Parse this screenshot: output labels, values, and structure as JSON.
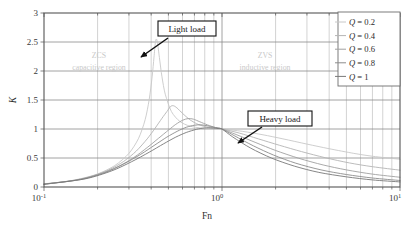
{
  "chart_data": {
    "type": "line",
    "title": "",
    "xlabel": "Fn",
    "ylabel": "K",
    "xscale": "log",
    "yscale": "linear",
    "xlim": [
      0.1,
      10
    ],
    "ylim": [
      0,
      3
    ],
    "xticks": [
      "10-1",
      "100",
      "101"
    ],
    "xtick_labels": [
      "10⁻¹",
      "10⁰",
      "10¹"
    ],
    "yticks": [
      0,
      0.5,
      1,
      1.5,
      2,
      2.5,
      3
    ],
    "ytick_labels": [
      "0",
      "0.5",
      "1",
      "1.5",
      "2",
      "2.5",
      "3"
    ],
    "grid": true,
    "grid_minor": true,
    "legend_position": "top-right",
    "series": [
      {
        "name": "Q = 0.2",
        "q": 0.2,
        "color": "#c8c8c8",
        "peak": {
          "fn": 0.42,
          "k": 2.55
        },
        "points": [
          {
            "fn": 0.1,
            "k": 0.055
          },
          {
            "fn": 0.13,
            "k": 0.092
          },
          {
            "fn": 0.16,
            "k": 0.142
          },
          {
            "fn": 0.2,
            "k": 0.225
          },
          {
            "fn": 0.25,
            "k": 0.37
          },
          {
            "fn": 0.3,
            "k": 0.58
          },
          {
            "fn": 0.34,
            "k": 0.84
          },
          {
            "fn": 0.37,
            "k": 1.16
          },
          {
            "fn": 0.39,
            "k": 1.51
          },
          {
            "fn": 0.405,
            "k": 1.9
          },
          {
            "fn": 0.415,
            "k": 2.24
          },
          {
            "fn": 0.422,
            "k": 2.48
          },
          {
            "fn": 0.428,
            "k": 2.552
          },
          {
            "fn": 0.435,
            "k": 2.47
          },
          {
            "fn": 0.445,
            "k": 2.23
          },
          {
            "fn": 0.46,
            "k": 1.9
          },
          {
            "fn": 0.48,
            "k": 1.6
          },
          {
            "fn": 0.52,
            "k": 1.3
          },
          {
            "fn": 0.58,
            "k": 1.13
          },
          {
            "fn": 0.66,
            "k": 1.05
          },
          {
            "fn": 0.78,
            "k": 1.015
          },
          {
            "fn": 1.0,
            "k": 1.0
          },
          {
            "fn": 1.3,
            "k": 0.96
          },
          {
            "fn": 1.7,
            "k": 0.9
          },
          {
            "fn": 2.2,
            "k": 0.83
          },
          {
            "fn": 3.0,
            "k": 0.74
          },
          {
            "fn": 4.0,
            "k": 0.66
          },
          {
            "fn": 5.5,
            "k": 0.58
          },
          {
            "fn": 7.0,
            "k": 0.53
          },
          {
            "fn": 10.0,
            "k": 0.478
          }
        ]
      },
      {
        "name": "Q = 0.4",
        "q": 0.4,
        "color": "#b4b4b4",
        "peak": {
          "fn": 0.52,
          "k": 1.4
        },
        "points": [
          {
            "fn": 0.1,
            "k": 0.052
          },
          {
            "fn": 0.14,
            "k": 0.103
          },
          {
            "fn": 0.18,
            "k": 0.175
          },
          {
            "fn": 0.23,
            "k": 0.292
          },
          {
            "fn": 0.28,
            "k": 0.44
          },
          {
            "fn": 0.33,
            "k": 0.62
          },
          {
            "fn": 0.38,
            "k": 0.83
          },
          {
            "fn": 0.42,
            "k": 1.01
          },
          {
            "fn": 0.46,
            "k": 1.185
          },
          {
            "fn": 0.49,
            "k": 1.3
          },
          {
            "fn": 0.515,
            "k": 1.39
          },
          {
            "fn": 0.535,
            "k": 1.4
          },
          {
            "fn": 0.56,
            "k": 1.36
          },
          {
            "fn": 0.6,
            "k": 1.27
          },
          {
            "fn": 0.66,
            "k": 1.16
          },
          {
            "fn": 0.74,
            "k": 1.075
          },
          {
            "fn": 0.85,
            "k": 1.025
          },
          {
            "fn": 1.0,
            "k": 1.0
          },
          {
            "fn": 1.25,
            "k": 0.93
          },
          {
            "fn": 1.6,
            "k": 0.83
          },
          {
            "fn": 2.1,
            "k": 0.72
          },
          {
            "fn": 2.8,
            "k": 0.61
          },
          {
            "fn": 3.8,
            "k": 0.505
          },
          {
            "fn": 5.2,
            "k": 0.415
          },
          {
            "fn": 7.0,
            "k": 0.35
          },
          {
            "fn": 10.0,
            "k": 0.29
          }
        ]
      },
      {
        "name": "Q = 0.6",
        "q": 0.6,
        "color": "#a0a0a0",
        "peak": {
          "fn": 0.6,
          "k": 1.18
        },
        "points": [
          {
            "fn": 0.1,
            "k": 0.05
          },
          {
            "fn": 0.15,
            "k": 0.118
          },
          {
            "fn": 0.2,
            "k": 0.212
          },
          {
            "fn": 0.26,
            "k": 0.35
          },
          {
            "fn": 0.32,
            "k": 0.51
          },
          {
            "fn": 0.38,
            "k": 0.68
          },
          {
            "fn": 0.44,
            "k": 0.84
          },
          {
            "fn": 0.5,
            "k": 0.98
          },
          {
            "fn": 0.55,
            "k": 1.08
          },
          {
            "fn": 0.6,
            "k": 1.15
          },
          {
            "fn": 0.645,
            "k": 1.18
          },
          {
            "fn": 0.69,
            "k": 1.17
          },
          {
            "fn": 0.75,
            "k": 1.125
          },
          {
            "fn": 0.83,
            "k": 1.07
          },
          {
            "fn": 0.92,
            "k": 1.025
          },
          {
            "fn": 1.0,
            "k": 1.0
          },
          {
            "fn": 1.2,
            "k": 0.905
          },
          {
            "fn": 1.55,
            "k": 0.765
          },
          {
            "fn": 2.0,
            "k": 0.63
          },
          {
            "fn": 2.7,
            "k": 0.495
          },
          {
            "fn": 3.7,
            "k": 0.38
          },
          {
            "fn": 5.0,
            "k": 0.295
          },
          {
            "fn": 7.0,
            "k": 0.222
          },
          {
            "fn": 10.0,
            "k": 0.168
          }
        ]
      },
      {
        "name": "Q = 0.8",
        "q": 0.8,
        "color": "#8c8c8c",
        "peak": {
          "fn": 0.7,
          "k": 1.08
        },
        "points": [
          {
            "fn": 0.1,
            "k": 0.048
          },
          {
            "fn": 0.16,
            "k": 0.128
          },
          {
            "fn": 0.22,
            "k": 0.248
          },
          {
            "fn": 0.28,
            "k": 0.395
          },
          {
            "fn": 0.35,
            "k": 0.565
          },
          {
            "fn": 0.42,
            "k": 0.725
          },
          {
            "fn": 0.49,
            "k": 0.86
          },
          {
            "fn": 0.56,
            "k": 0.96
          },
          {
            "fn": 0.63,
            "k": 1.03
          },
          {
            "fn": 0.7,
            "k": 1.065
          },
          {
            "fn": 0.76,
            "k": 1.072
          },
          {
            "fn": 0.83,
            "k": 1.055
          },
          {
            "fn": 0.9,
            "k": 1.03
          },
          {
            "fn": 1.0,
            "k": 1.0
          },
          {
            "fn": 1.18,
            "k": 0.88
          },
          {
            "fn": 1.5,
            "k": 0.71
          },
          {
            "fn": 1.95,
            "k": 0.55
          },
          {
            "fn": 2.6,
            "k": 0.41
          },
          {
            "fn": 3.6,
            "k": 0.295
          },
          {
            "fn": 5.0,
            "k": 0.215
          },
          {
            "fn": 7.0,
            "k": 0.155
          },
          {
            "fn": 10.0,
            "k": 0.112
          }
        ]
      },
      {
        "name": "Q = 1",
        "q": 1.0,
        "color": "#787878",
        "peak": {
          "fn": 0.8,
          "k": 1.02
        },
        "points": [
          {
            "fn": 0.1,
            "k": 0.046
          },
          {
            "fn": 0.17,
            "k": 0.14
          },
          {
            "fn": 0.24,
            "k": 0.278
          },
          {
            "fn": 0.31,
            "k": 0.435
          },
          {
            "fn": 0.39,
            "k": 0.6
          },
          {
            "fn": 0.47,
            "k": 0.745
          },
          {
            "fn": 0.55,
            "k": 0.86
          },
          {
            "fn": 0.63,
            "k": 0.94
          },
          {
            "fn": 0.72,
            "k": 0.995
          },
          {
            "fn": 0.8,
            "k": 1.018
          },
          {
            "fn": 0.88,
            "k": 1.018
          },
          {
            "fn": 0.95,
            "k": 1.008
          },
          {
            "fn": 1.0,
            "k": 1.0
          },
          {
            "fn": 1.15,
            "k": 0.862
          },
          {
            "fn": 1.45,
            "k": 0.67
          },
          {
            "fn": 1.9,
            "k": 0.498
          },
          {
            "fn": 2.55,
            "k": 0.36
          },
          {
            "fn": 3.5,
            "k": 0.252
          },
          {
            "fn": 5.0,
            "k": 0.175
          },
          {
            "fn": 7.0,
            "k": 0.122
          },
          {
            "fn": 10.0,
            "k": 0.088
          }
        ]
      }
    ],
    "annotations": [
      {
        "id": "light-load",
        "text": "Light load",
        "box": {
          "x": 158,
          "y": 21,
          "w": 58,
          "h": 15
        },
        "arrow": {
          "x1": 168,
          "y1": 38,
          "x2": 141,
          "y2": 57
        }
      },
      {
        "id": "heavy-load",
        "text": "Heavy load",
        "box": {
          "x": 248,
          "y": 111,
          "w": 64,
          "h": 15
        },
        "arrow": {
          "x1": 262,
          "y1": 127,
          "x2": 238,
          "y2": 143
        }
      },
      {
        "id": "zcs-region",
        "line1": "ZCS",
        "line2": "capacitive region",
        "x": 99,
        "y1": 58,
        "y2": 70
      },
      {
        "id": "zvs-region",
        "line1": "ZVS",
        "line2": "inductive region",
        "x": 265,
        "y1": 58,
        "y2": 70
      }
    ]
  },
  "legend": {
    "items": [
      {
        "q_symbol": "Q",
        "eq": " = 0.2"
      },
      {
        "q_symbol": "Q",
        "eq": " = 0.4"
      },
      {
        "q_symbol": "Q",
        "eq": " = 0.6"
      },
      {
        "q_symbol": "Q",
        "eq": " = 0.8"
      },
      {
        "q_symbol": "Q",
        "eq": " = 1"
      }
    ]
  },
  "colors": {
    "frame": "#555555",
    "grid_major": "#8a8a8a",
    "grid_minor": "#b5b5b5",
    "region_text": "#cccccc",
    "background": "#ffffff",
    "text": "#2b2b2b"
  }
}
